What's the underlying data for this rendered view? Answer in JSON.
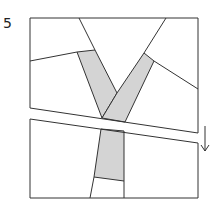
{
  "figure": {
    "label": "5",
    "stroke_color": "#333333",
    "fill_color": "#d4d4d4",
    "background": "#ffffff",
    "arrow": {
      "direction": "down",
      "x": 205,
      "y1": 126,
      "y2": 151
    }
  }
}
